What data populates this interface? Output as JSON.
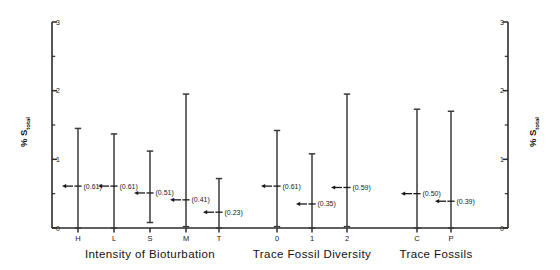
{
  "chart_data": {
    "type": "scatter",
    "title": "",
    "ylabel": "% S total",
    "ylabel_main": "% S",
    "ylabel_subscript": "total",
    "xlabel": "",
    "ylim": [
      0,
      3
    ],
    "y_major_ticks": [
      0,
      1,
      2,
      3
    ],
    "y_major_tick_labels": [
      "0",
      "1",
      "2",
      "3"
    ],
    "y_minor_ticks": [
      0.5,
      1.5,
      2.5
    ],
    "grid": false,
    "legend": "none",
    "dual_y_axis": true,
    "marker_style": "left-pointing-arrow-at-mean",
    "series_style": "vertical range bar with end caps and mean arrow marker",
    "groups": [
      {
        "name": "Intensity of Bioturbation",
        "categories": [
          "H",
          "L",
          "S",
          "M",
          "T"
        ],
        "points": [
          {
            "label": "H",
            "mean": 0.61,
            "mean_text": "(0.61)",
            "low": 0.0,
            "high": 1.45
          },
          {
            "label": "L",
            "mean": 0.61,
            "mean_text": "(0.61)",
            "low": 0.0,
            "high": 1.37
          },
          {
            "label": "S",
            "mean": 0.51,
            "mean_text": "(0.51)",
            "low": 0.08,
            "high": 1.12
          },
          {
            "label": "M",
            "mean": 0.41,
            "mean_text": "(0.41)",
            "low": 0.02,
            "high": 1.95
          },
          {
            "label": "T",
            "mean": 0.23,
            "mean_text": "(0.23)",
            "low": 0.0,
            "high": 0.72
          }
        ]
      },
      {
        "name": "Trace Fossil Diversity",
        "categories": [
          "0",
          "1",
          "2"
        ],
        "points": [
          {
            "label": "0",
            "mean": 0.61,
            "mean_text": "(0.61)",
            "low": 0.02,
            "high": 1.42
          },
          {
            "label": "1",
            "mean": 0.35,
            "mean_text": "(0.35)",
            "low": 0.0,
            "high": 1.08
          },
          {
            "label": "2",
            "mean": 0.59,
            "mean_text": "(0.59)",
            "low": 0.02,
            "high": 1.95
          }
        ]
      },
      {
        "name": "Trace Fossils",
        "categories": [
          "C",
          "P"
        ],
        "points": [
          {
            "label": "C",
            "mean": 0.5,
            "mean_text": "(0.50)",
            "low": 0.0,
            "high": 1.73
          },
          {
            "label": "P",
            "mean": 0.39,
            "mean_text": "(0.39)",
            "low": 0.0,
            "high": 1.7
          }
        ]
      }
    ]
  },
  "colors": {
    "axis": "#2b2b2b",
    "line": "#3a3a3a",
    "marker": "#1a1a1a",
    "text": "#111111",
    "background": "#ffffff"
  }
}
